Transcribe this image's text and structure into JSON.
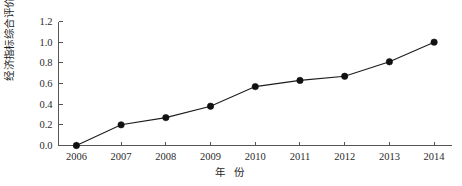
{
  "chart_data": {
    "type": "line",
    "title": "",
    "subtitle": "",
    "xlabel": "年 份",
    "ylabel": "经济指标综合评价值",
    "categories": [
      "2006",
      "2007",
      "2008",
      "2009",
      "2010",
      "2011",
      "2012",
      "2013",
      "2014"
    ],
    "x": [
      2006,
      2007,
      2008,
      2009,
      2010,
      2011,
      2012,
      2013,
      2014
    ],
    "values": [
      0.0,
      0.2,
      0.27,
      0.38,
      0.57,
      0.63,
      0.67,
      0.81,
      1.0
    ],
    "series": [
      {
        "name": "经济指标综合评价值",
        "values": [
          0.0,
          0.2,
          0.27,
          0.38,
          0.57,
          0.63,
          0.67,
          0.81,
          1.0
        ],
        "color": "#111111",
        "marker": "filled-circle"
      }
    ],
    "xlim": [
      2005.6,
      2014.4
    ],
    "ylim": [
      0.0,
      1.2
    ],
    "yticks": [
      0.0,
      0.2,
      0.4,
      0.6,
      0.8,
      1.0,
      1.2
    ],
    "ytick_labels": [
      "0.0",
      "0.2",
      "0.4",
      "0.6",
      "0.8",
      "1.0",
      "1.2"
    ],
    "xtick_labels": [
      "2006",
      "2007",
      "2008",
      "2009",
      "2010",
      "2011",
      "2012",
      "2013",
      "2014"
    ],
    "grid": false,
    "legend": false,
    "legend_position": "none",
    "axis_color": "#555555",
    "background": "#ffffff",
    "line_color": "#1c1c1c",
    "marker_color": "#111111"
  }
}
